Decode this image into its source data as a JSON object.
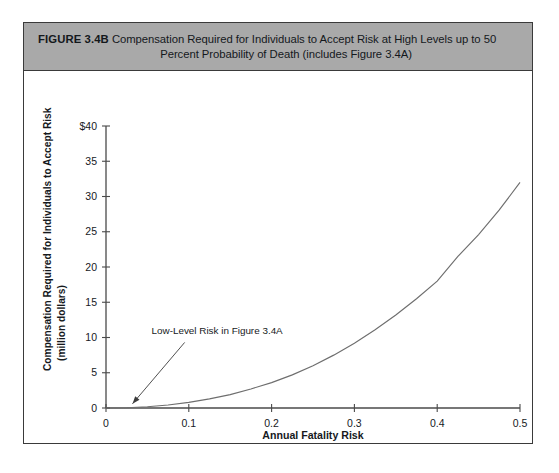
{
  "figure": {
    "label": "FIGURE 3.4B",
    "title_line1": "Compensation Required for Individuals to Accept Risk at High Levels up to 50",
    "title_line2": "Percent Probability of Death (includes Figure 3.4A)",
    "header_bg": "#a9a9a9",
    "border_color": "#3a3a3a"
  },
  "chart_data": {
    "type": "line",
    "title": "",
    "xlabel": "Annual Fatality Risk",
    "ylabel": "Compensation Required for Individuals to Accept Risk (million dollars)",
    "ylabel_line1": "Compensation Required for Individuals to Accept Risk",
    "ylabel_line2": "(million dollars)",
    "xlim": [
      0,
      0.5
    ],
    "ylim": [
      0,
      40
    ],
    "grid": false,
    "legend": null,
    "xticks": [
      0,
      0.1,
      0.2,
      0.3,
      0.4,
      0.5
    ],
    "xticklabels": [
      "0",
      "0.1",
      "0.2",
      "0.3",
      "0.4",
      "0.5"
    ],
    "yticks": [
      0,
      5,
      10,
      15,
      20,
      25,
      30,
      35,
      40
    ],
    "yticklabels": [
      "0",
      "5",
      "10",
      "15",
      "20",
      "25",
      "30",
      "35",
      "$40"
    ],
    "curve_color": "#6e6e6e",
    "series": [
      {
        "name": "Compensation required",
        "x": [
          0,
          0.025,
          0.05,
          0.075,
          0.1,
          0.125,
          0.15,
          0.175,
          0.2,
          0.225,
          0.25,
          0.275,
          0.3,
          0.325,
          0.35,
          0.375,
          0.4,
          0.425,
          0.45,
          0.475,
          0.5
        ],
        "values": [
          0,
          0.04,
          0.18,
          0.42,
          0.8,
          1.3,
          1.9,
          2.7,
          3.6,
          4.7,
          6.0,
          7.5,
          9.2,
          11.1,
          13.2,
          15.5,
          18.0,
          21.5,
          24.6,
          28.1,
          32.0
        ]
      }
    ],
    "annotations": [
      {
        "text": "Low-Level Risk in Figure 3.4A",
        "text_x": 0.055,
        "text_y": 10.5,
        "arrow_from_x": 0.095,
        "arrow_from_y": 9.3,
        "arrow_to_x": 0.032,
        "arrow_to_y": 0.6
      }
    ]
  }
}
